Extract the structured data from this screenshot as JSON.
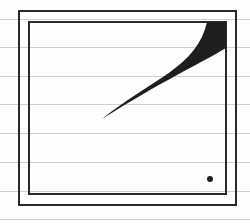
{
  "drawing": {
    "width": 250,
    "height": 223,
    "colors": {
      "paper": "#fefefe",
      "ruled_line": "#cfcfcf",
      "ink": "#2a2a2a",
      "fill": "#1e1e1e"
    },
    "ruled_lines_y": [
      19,
      47,
      76,
      104,
      133,
      162,
      191,
      219
    ],
    "outer_box": {
      "x": 19,
      "y": 11,
      "width": 217,
      "height": 194
    },
    "inner_box": {
      "x": 29,
      "y": 22,
      "width": 197,
      "height": 172
    },
    "wedge_shape": {
      "tip": [
        102,
        119
      ],
      "top_left": [
        207,
        22
      ],
      "top_right": [
        226,
        22
      ],
      "bottom_right": [
        226,
        48
      ]
    },
    "dot": {
      "cx": 210,
      "cy": 179,
      "r": 3
    }
  }
}
